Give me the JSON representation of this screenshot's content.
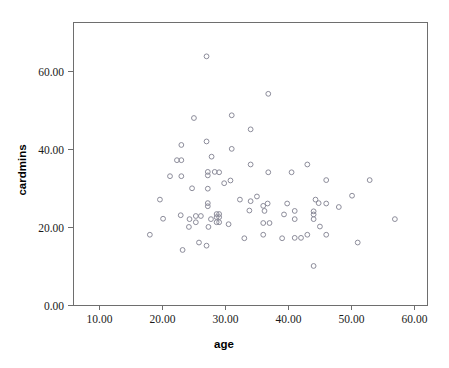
{
  "chart_data": {
    "type": "scatter",
    "title": "",
    "xlabel": "age",
    "ylabel": "cardmins",
    "xlim": [
      5.8,
      62.0
    ],
    "ylim": [
      0.0,
      72.5
    ],
    "grid": false,
    "legend": "none",
    "marker": "open-circle",
    "marker_color": "#8c8c9a",
    "frame_color": "#6e6e6e",
    "x_ticks": [
      "10.00",
      "20.00",
      "30.00",
      "40.00",
      "50.00",
      "60.00"
    ],
    "x_tick_values": [
      10,
      20,
      30,
      40,
      50,
      60
    ],
    "y_ticks": [
      "0.00",
      "20.00",
      "40.00",
      "60.00"
    ],
    "y_tick_values": [
      0,
      20,
      40,
      60
    ],
    "points": [
      {
        "x": 27.0,
        "y": 63.7
      },
      {
        "x": 36.8,
        "y": 54.1
      },
      {
        "x": 31.0,
        "y": 48.6
      },
      {
        "x": 25.0,
        "y": 47.9
      },
      {
        "x": 34.0,
        "y": 45.0
      },
      {
        "x": 27.0,
        "y": 41.9
      },
      {
        "x": 23.0,
        "y": 41.0
      },
      {
        "x": 31.0,
        "y": 40.0
      },
      {
        "x": 27.8,
        "y": 38.0
      },
      {
        "x": 22.3,
        "y": 37.1
      },
      {
        "x": 23.0,
        "y": 37.1
      },
      {
        "x": 34.0,
        "y": 36.0
      },
      {
        "x": 43.0,
        "y": 36.0
      },
      {
        "x": 27.2,
        "y": 34.1
      },
      {
        "x": 28.3,
        "y": 34.1
      },
      {
        "x": 29.0,
        "y": 34.0
      },
      {
        "x": 36.8,
        "y": 34.0
      },
      {
        "x": 40.5,
        "y": 34.0
      },
      {
        "x": 27.2,
        "y": 33.2
      },
      {
        "x": 21.2,
        "y": 33.0
      },
      {
        "x": 23.0,
        "y": 33.0
      },
      {
        "x": 46.0,
        "y": 32.0
      },
      {
        "x": 52.9,
        "y": 32.0
      },
      {
        "x": 30.8,
        "y": 31.9
      },
      {
        "x": 29.8,
        "y": 31.2
      },
      {
        "x": 24.7,
        "y": 29.9
      },
      {
        "x": 27.2,
        "y": 29.8
      },
      {
        "x": 50.1,
        "y": 28.0
      },
      {
        "x": 35.0,
        "y": 27.8
      },
      {
        "x": 19.6,
        "y": 27.0
      },
      {
        "x": 32.3,
        "y": 27.0
      },
      {
        "x": 44.3,
        "y": 27.0
      },
      {
        "x": 27.2,
        "y": 26.1
      },
      {
        "x": 34.0,
        "y": 26.6
      },
      {
        "x": 36.7,
        "y": 26.0
      },
      {
        "x": 39.8,
        "y": 26.0
      },
      {
        "x": 44.8,
        "y": 26.1
      },
      {
        "x": 46.0,
        "y": 26.0
      },
      {
        "x": 27.2,
        "y": 25.3
      },
      {
        "x": 36.0,
        "y": 25.4
      },
      {
        "x": 48.0,
        "y": 25.1
      },
      {
        "x": 33.8,
        "y": 24.2
      },
      {
        "x": 36.2,
        "y": 24.1
      },
      {
        "x": 41.0,
        "y": 24.1
      },
      {
        "x": 44.0,
        "y": 24.0
      },
      {
        "x": 28.6,
        "y": 23.3
      },
      {
        "x": 29.0,
        "y": 23.3
      },
      {
        "x": 39.3,
        "y": 23.2
      },
      {
        "x": 44.0,
        "y": 23.2
      },
      {
        "x": 22.9,
        "y": 23.0
      },
      {
        "x": 25.3,
        "y": 22.8
      },
      {
        "x": 26.1,
        "y": 22.8
      },
      {
        "x": 28.6,
        "y": 22.5
      },
      {
        "x": 29.0,
        "y": 22.5
      },
      {
        "x": 20.1,
        "y": 22.1
      },
      {
        "x": 24.3,
        "y": 22.0
      },
      {
        "x": 27.7,
        "y": 22.0
      },
      {
        "x": 41.0,
        "y": 22.0
      },
      {
        "x": 44.0,
        "y": 22.0
      },
      {
        "x": 56.9,
        "y": 22.0
      },
      {
        "x": 25.3,
        "y": 21.2
      },
      {
        "x": 28.6,
        "y": 21.2
      },
      {
        "x": 29.0,
        "y": 21.2
      },
      {
        "x": 36.0,
        "y": 21.0
      },
      {
        "x": 37.0,
        "y": 21.0
      },
      {
        "x": 30.5,
        "y": 20.7
      },
      {
        "x": 45.0,
        "y": 20.1
      },
      {
        "x": 24.2,
        "y": 20.0
      },
      {
        "x": 27.3,
        "y": 20.0
      },
      {
        "x": 33.0,
        "y": 17.1
      },
      {
        "x": 36.0,
        "y": 18.0
      },
      {
        "x": 39.0,
        "y": 17.1
      },
      {
        "x": 41.0,
        "y": 17.2
      },
      {
        "x": 42.0,
        "y": 17.2
      },
      {
        "x": 43.0,
        "y": 18.0
      },
      {
        "x": 46.0,
        "y": 18.0
      },
      {
        "x": 18.0,
        "y": 18.0
      },
      {
        "x": 25.8,
        "y": 16.0
      },
      {
        "x": 51.0,
        "y": 16.0
      },
      {
        "x": 27.0,
        "y": 15.2
      },
      {
        "x": 23.2,
        "y": 14.1
      },
      {
        "x": 44.0,
        "y": 10.0
      }
    ]
  }
}
